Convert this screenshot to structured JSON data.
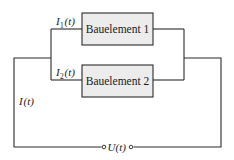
{
  "diagram": {
    "type": "circuit",
    "components": [
      {
        "id": "component-1",
        "label": "Bauelement 1"
      },
      {
        "id": "component-2",
        "label": "Bauelement 2"
      }
    ],
    "currents": {
      "branch1": {
        "symbol": "I",
        "subscript": "1",
        "arg": "(t)"
      },
      "branch2": {
        "symbol": "I",
        "subscript": "2",
        "arg": "(t)"
      },
      "total": {
        "symbol": "I",
        "arg": "(t)"
      }
    },
    "voltage": {
      "symbol": "U",
      "arg": "(t)"
    },
    "colors": {
      "wire": "#2a2a2a",
      "box_fill": "#ececec",
      "background": "#ffffff"
    }
  }
}
